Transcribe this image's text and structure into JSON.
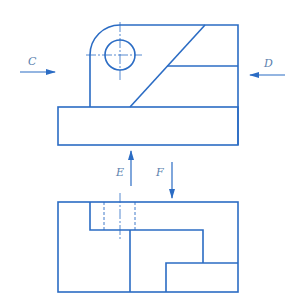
{
  "diagram": {
    "type": "orthographic-projection",
    "line_color": "#2b6cc4",
    "arrow_color": "#2b6cc4",
    "label_color": "#5a7fae",
    "views": [
      {
        "name": "front-view",
        "position": "top"
      },
      {
        "name": "top-view",
        "position": "bottom"
      }
    ],
    "arrows": [
      {
        "label": "C",
        "direction": "right"
      },
      {
        "label": "D",
        "direction": "left"
      },
      {
        "label": "E",
        "direction": "up"
      },
      {
        "label": "F",
        "direction": "down"
      }
    ]
  }
}
